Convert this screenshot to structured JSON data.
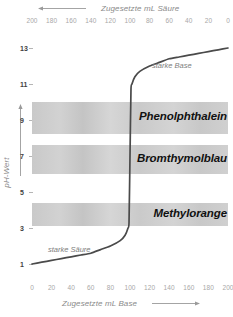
{
  "chart_data": {
    "type": "line",
    "title": "",
    "xlabel": "Zugesetzte mL Base",
    "xlabel_top": "Zugesetzte mL Säure",
    "ylabel": "pH-Wert",
    "xlim": [
      0,
      200
    ],
    "ylim": [
      0,
      14
    ],
    "grid": false,
    "legend": "none",
    "x_ticks": [
      0,
      20,
      40,
      60,
      80,
      100,
      120,
      140,
      160,
      180,
      200
    ],
    "x_ticks_top": [
      200,
      180,
      160,
      140,
      120,
      100,
      80,
      60,
      40,
      20,
      0
    ],
    "y_ticks": [
      1,
      3,
      5,
      7,
      9,
      11,
      13
    ],
    "series": [
      {
        "name": "Titrationskurve starke Säure / starke Base",
        "x": [
          0,
          10,
          20,
          30,
          40,
          50,
          60,
          70,
          80,
          90,
          95,
          98,
          99,
          100,
          101,
          102,
          105,
          110,
          120,
          130,
          140,
          150,
          160,
          170,
          180,
          190,
          200
        ],
        "y": [
          1.0,
          1.1,
          1.2,
          1.3,
          1.4,
          1.5,
          1.6,
          1.8,
          2.0,
          2.3,
          2.6,
          3.0,
          3.3,
          7.0,
          10.7,
          11.0,
          11.4,
          11.7,
          12.0,
          12.2,
          12.4,
          12.5,
          12.6,
          12.7,
          12.8,
          12.9,
          13.0
        ]
      }
    ],
    "annotations": [
      {
        "text": "starke Base",
        "x": 143,
        "y": 12.5
      },
      {
        "text": "starke Säure",
        "x": 33,
        "y": 1.9
      }
    ],
    "indicator_bands": [
      {
        "name": "Phenolphthalein",
        "ph_low": 8.2,
        "ph_high": 10.0
      },
      {
        "name": "Bromthymolblau",
        "ph_low": 6.0,
        "ph_high": 7.6
      },
      {
        "name": "Methylorange",
        "ph_low": 3.1,
        "ph_high": 4.4
      }
    ],
    "colors": {
      "curve": "#4a4a4a",
      "band": "#cccccc",
      "tick_text": "#a8a8a8",
      "axis_title": "#8a8a8a",
      "ylabel_text": "#3f3f3f",
      "band_label": "#111111",
      "annotation": "#7d7d7d",
      "background": "#ffffff"
    }
  },
  "axes": {
    "top_title": "Zugesetzte mL Säure",
    "bottom_title": "Zugesetzte mL Base",
    "y_title": "pH-Wert"
  },
  "top_tick_labels": [
    "200",
    "180",
    "160",
    "140",
    "120",
    "100",
    "80",
    "60",
    "40",
    "20",
    "0"
  ],
  "bottom_tick_labels": [
    "0",
    "20",
    "40",
    "60",
    "80",
    "100",
    "120",
    "140",
    "160",
    "180",
    "200"
  ],
  "y_tick_labels": [
    "13",
    "11",
    "9",
    "7",
    "5",
    "3",
    "1"
  ],
  "bands": [
    {
      "label": "Phenolphthalein"
    },
    {
      "label": "Bromthymolblau"
    },
    {
      "label": "Methylorange"
    }
  ],
  "annotations": {
    "base": "starke Base",
    "acid": "starke Säure"
  }
}
